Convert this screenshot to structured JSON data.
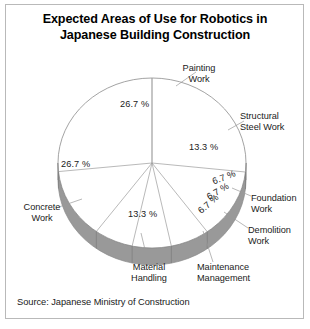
{
  "figure": {
    "title_line_1": "Expected Areas of Use for Robotics in",
    "title_line_2": "Japanese Building Construction",
    "source": "Source: Japanese Ministry of Construction"
  },
  "chart_data": {
    "type": "pie",
    "title": "Expected Areas of Use for Robotics in Japanese Building Construction",
    "subtitle": "",
    "xlabel": "",
    "ylabel": "",
    "legend_position": "none",
    "grid": false,
    "three_d": true,
    "units": "percent",
    "value_label_suffix": "%",
    "source": "Source: Japanese Ministry of Construction",
    "colors": {
      "slice_face": "#ffffff",
      "slice_side": "#999999",
      "outline": "#8c8c8c",
      "leader_line": "#9a9a9a",
      "text": "#1b1b1b",
      "frame": "#b9b9b9",
      "background": "#ffffff"
    },
    "categories": [
      "Painting Work",
      "Structural Steel Work",
      "Foundation Work",
      "Demolition Work",
      "Maintenance Management",
      "Material Handling",
      "Concrete Work"
    ],
    "values": [
      26.7,
      13.3,
      6.7,
      6.7,
      6.7,
      13.3,
      26.7
    ],
    "value_labels": [
      "26.7 %",
      "13.3 %",
      "6.7 %",
      "6.7 %",
      "6.7 %",
      "13.3 %",
      "26.7 %"
    ],
    "slices": [
      {
        "label": "Painting Work",
        "label_lines": [
          "Painting",
          "Work"
        ],
        "value": 26.7,
        "value_label": "26.7 %",
        "start_angle_deg": 270,
        "end_angle_deg": 366.1
      },
      {
        "label": "Structural Steel Work",
        "label_lines": [
          "Structural",
          "Steel Work"
        ],
        "value": 13.3,
        "value_label": "13.3 %",
        "start_angle_deg": 366.1,
        "end_angle_deg": 414.0
      },
      {
        "label": "Foundation Work",
        "label_lines": [
          "Foundation",
          "Work"
        ],
        "value": 6.7,
        "value_label": "6.7 %",
        "start_angle_deg": 414.0,
        "end_angle_deg": 438.1
      },
      {
        "label": "Demolition Work",
        "label_lines": [
          "Demolition",
          "Work"
        ],
        "value": 6.7,
        "value_label": "6.7 %",
        "start_angle_deg": 438.1,
        "end_angle_deg": 462.2
      },
      {
        "label": "Maintenance Management",
        "label_lines": [
          "Maintenance",
          "Management"
        ],
        "value": 6.7,
        "value_label": "6.7 %",
        "start_angle_deg": 462.2,
        "end_angle_deg": 486.3
      },
      {
        "label": "Material Handling",
        "label_lines": [
          "Material",
          "Handling"
        ],
        "value": 13.3,
        "value_label": "13.3 %",
        "start_angle_deg": 486.3,
        "end_angle_deg": 534.2
      },
      {
        "label": "Concrete Work",
        "label_lines": [
          "Concrete",
          "Work"
        ],
        "value": 26.7,
        "value_label": "26.7 %",
        "start_angle_deg": 534.2,
        "end_angle_deg": 630.0
      }
    ]
  }
}
